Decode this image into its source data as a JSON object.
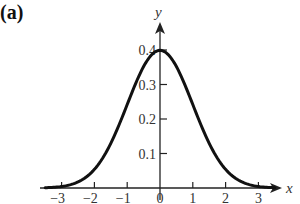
{
  "panel_label": "(a)",
  "chart_data": {
    "type": "line",
    "title": "",
    "panel_label": "(a)",
    "xlabel": "x",
    "ylabel": "y",
    "xlim": [
      -3.5,
      3.7
    ],
    "ylim": [
      0,
      0.45
    ],
    "grid": false,
    "legend": null,
    "x_ticks": [
      -3,
      -2,
      -1,
      0,
      1,
      2,
      3
    ],
    "x_tick_labels": [
      "−3",
      "−2",
      "−1",
      "0",
      "1",
      "2",
      "3"
    ],
    "y_ticks": [
      0.1,
      0.2,
      0.3,
      0.4
    ],
    "y_tick_labels": [
      "0.1",
      "0.2",
      "0.3",
      "0.4"
    ],
    "series": [
      {
        "name": "standard normal density",
        "function": "exp(-x^2/2)/sqrt(2*pi)",
        "x": [
          -3.5,
          -3,
          -2.5,
          -2,
          -1.5,
          -1,
          -0.5,
          0,
          0.5,
          1,
          1.5,
          2,
          2.5,
          3,
          3.5
        ],
        "values": [
          0.0009,
          0.0044,
          0.0175,
          0.054,
          0.1295,
          0.242,
          0.3521,
          0.3989,
          0.3521,
          0.242,
          0.1295,
          0.054,
          0.0175,
          0.0044,
          0.0009
        ]
      }
    ]
  },
  "colors": {
    "curve": "#111111",
    "axis": "#222222",
    "text": "#333333"
  }
}
